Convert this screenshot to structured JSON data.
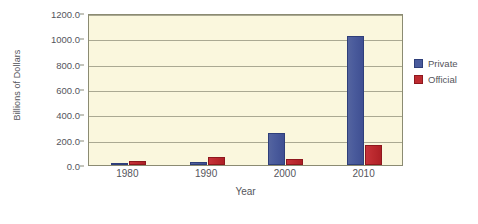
{
  "chart_data": {
    "type": "bar",
    "title": "",
    "xlabel": "Year",
    "ylabel": "Billions of Dollars",
    "categories": [
      "1980",
      "1990",
      "2000",
      "2010"
    ],
    "series": [
      {
        "name": "Private",
        "color": "#4a5b9c",
        "values": [
          10,
          25,
          255,
          1020
        ]
      },
      {
        "name": "Official",
        "color": "#bd2b30",
        "values": [
          35,
          65,
          50,
          155
        ]
      }
    ],
    "ylim": [
      0,
      1200
    ],
    "ytick_step": 200,
    "ytick_labels": [
      "0.0",
      "200.0",
      "400.0",
      "600.0",
      "800.0",
      "1000.0",
      "1200.0"
    ],
    "ytick_values": [
      0,
      200,
      400,
      600,
      800,
      1000,
      1200
    ],
    "grid": true,
    "legend_position": "right",
    "plot_background": "#faf7dd",
    "page_background": "#ffffff",
    "axis_color": "#8b8b72"
  }
}
